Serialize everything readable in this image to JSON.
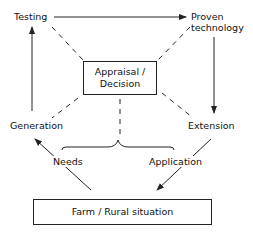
{
  "diagram": {
    "nodes": {
      "testing": "Testing",
      "proven_line1": "Proven",
      "proven_line2": "technology",
      "appraisal_line1": "Appraisal /",
      "appraisal_line2": "Decision",
      "generation": "Generation",
      "extension": "Extension",
      "farm": "Farm / Rural situation"
    },
    "edge_labels": {
      "needs": "Needs",
      "application": "Application"
    },
    "colors": {
      "line": "#222222",
      "background": "#ffffff"
    }
  }
}
